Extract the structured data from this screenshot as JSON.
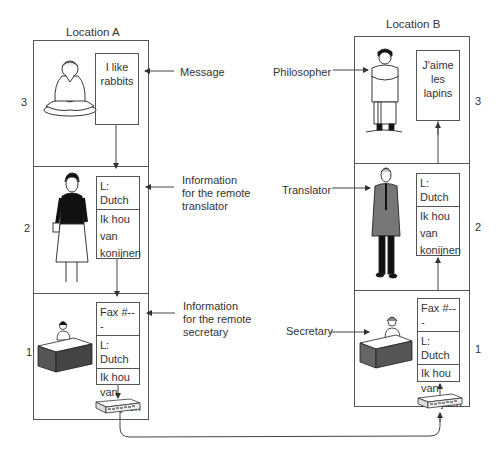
{
  "locations": {
    "a": {
      "title": "Location A"
    },
    "b": {
      "title": "Location B"
    }
  },
  "levels": [
    "3",
    "2",
    "1"
  ],
  "documents": {
    "a3": {
      "lines": [
        "I like",
        "rabbits"
      ]
    },
    "a2": {
      "header": "L: Dutch",
      "lines": [
        "Ik hou",
        "van",
        "konijnen"
      ]
    },
    "a1": {
      "fax": "Fax #---",
      "header": "L: Dutch",
      "lines": [
        "Ik hou",
        "van",
        "konijnen"
      ]
    },
    "b3": {
      "lines": [
        "J'aime",
        "les",
        "lapins"
      ]
    },
    "b2": {
      "header": "L: Dutch",
      "lines": [
        "Ik hou",
        "van",
        "konijnen"
      ]
    },
    "b1": {
      "fax": "Fax #---",
      "header": "L: Dutch",
      "lines": [
        "Ik hou",
        "van",
        "konijnen"
      ]
    }
  },
  "annotations": {
    "message": "Message",
    "info_translator": [
      "Information",
      "for the remote",
      "translator"
    ],
    "info_secretary": [
      "Information",
      "for the remote",
      "secretary"
    ],
    "philosopher": "Philosopher",
    "translator": "Translator",
    "secretary": "Secretary"
  },
  "figures": {
    "a3": "meditating-philosopher-icon",
    "a2": "female-translator-icon",
    "a1": "secretary-at-desk-icon",
    "b3": "standing-philosopher-icon",
    "b2": "male-translator-icon",
    "b1": "secretary-at-desk-icon"
  },
  "colors": {
    "line": "#555555",
    "text": "#333333"
  }
}
